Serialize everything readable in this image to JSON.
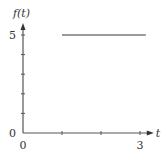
{
  "chart_data": {
    "type": "line",
    "title": "",
    "xlabel": "t",
    "ylabel": "f(t)",
    "xlim": [
      0,
      3.2
    ],
    "ylim": [
      0,
      5.3
    ],
    "x_ticks": [
      0,
      1,
      2,
      3
    ],
    "x_tick_labels": {
      "0": "0",
      "3": "3"
    },
    "y_ticks": [
      0,
      1,
      2,
      3,
      4,
      5
    ],
    "y_tick_labels": {
      "0": "0",
      "5": "5"
    },
    "grid": false,
    "series": [
      {
        "name": "f(t)",
        "x": [
          1,
          3.15
        ],
        "y": [
          5,
          5
        ],
        "color": "#9a9a9a"
      }
    ],
    "origin_label": "0"
  }
}
